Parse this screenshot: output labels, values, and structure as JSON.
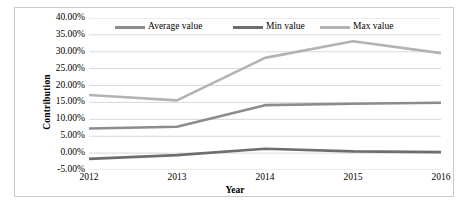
{
  "chart_data": {
    "type": "line",
    "title": "",
    "xlabel": "Year",
    "ylabel": "Contribution",
    "categories": [
      "2012",
      "2013",
      "2014",
      "2015",
      "2016"
    ],
    "x": [
      2012,
      2013,
      2014,
      2015,
      2016
    ],
    "ylim": [
      -5,
      40
    ],
    "ytick_step": 5,
    "ytick_labels": [
      "40.00%",
      "35.00%",
      "30.00%",
      "25.00%",
      "20.00%",
      "15.00%",
      "10.00%",
      "5.00%",
      "0.00%",
      "-5.00%"
    ],
    "ytick_values": [
      40,
      35,
      30,
      25,
      20,
      15,
      10,
      5,
      0,
      -5
    ],
    "grid": "horizontal",
    "legend_position": "top",
    "value_unit": "percent",
    "series": [
      {
        "name": "Average value",
        "color": "#8c8c8c",
        "values": [
          7.3,
          7.8,
          14.2,
          14.6,
          14.9
        ]
      },
      {
        "name": "Min value",
        "color": "#6e6e6e",
        "values": [
          -1.7,
          -0.6,
          1.3,
          0.5,
          0.3
        ]
      },
      {
        "name": "Max value",
        "color": "#b3b3b3",
        "values": [
          17.2,
          15.6,
          28.2,
          33.1,
          29.6
        ]
      }
    ]
  },
  "colors": {
    "border": "#c9c9c9",
    "gridline": "#d9d9d9",
    "text": "#000000",
    "background": "#ffffff"
  }
}
